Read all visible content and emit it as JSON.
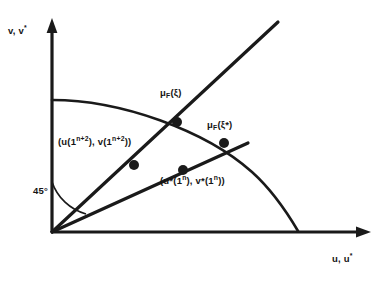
{
  "figure": {
    "type": "line-diagram",
    "background_color": "#ffffff",
    "stroke_color": "#1a1a1a",
    "axes": {
      "y_label": "v, v*",
      "y_label_base": "v, v",
      "y_label_sup": "*",
      "x_label": "u, u*",
      "x_label_base": "u, u",
      "x_label_sup": "*",
      "origin": {
        "x": 52,
        "y": 232
      },
      "y_axis_top": {
        "x": 52,
        "y": 22
      },
      "x_axis_right": {
        "x": 370,
        "y": 232
      }
    },
    "angle_marker": {
      "label": "45°",
      "value": 45,
      "unit": "degrees"
    },
    "labels": {
      "mu_xi": {
        "mu": "μ",
        "sub": "F",
        "arg": "(ξ)",
        "full": "μF(ξ)"
      },
      "mu_xi_star": {
        "mu": "μ",
        "sub": "F",
        "arg": "(ξ*)",
        "full": "μF(ξ*)"
      },
      "point_upper": {
        "prefix": "(u(1",
        "sup1": "n+2",
        "mid": "), v(1",
        "sup2": "n+2",
        "suffix": "))",
        "full": "(u(1^n+2), v(1^n+2))"
      },
      "point_lower": {
        "prefix": "(u*(1",
        "sup1": "n",
        "mid": "), v*(1",
        "sup2": "n",
        "suffix": "))",
        "full": "(u*(1^n), v*(1^n))"
      }
    },
    "curve": {
      "name": "frontier-curve",
      "description": "concave frontier from y-axis to x-axis",
      "start": {
        "x": 52,
        "y": 100
      },
      "end": {
        "x": 298,
        "y": 231
      }
    },
    "rays": [
      {
        "name": "ray-45-degree",
        "from": {
          "x": 52,
          "y": 232
        },
        "to": {
          "x": 278,
          "y": 22
        }
      },
      {
        "name": "ray-lower",
        "from": {
          "x": 52,
          "y": 232
        },
        "to": {
          "x": 248,
          "y": 143
        }
      }
    ],
    "points": [
      {
        "name": "point-mu-xi",
        "x": 177,
        "y": 122
      },
      {
        "name": "point-mu-xi-star",
        "x": 224,
        "y": 143
      },
      {
        "name": "point-upper-interior",
        "x": 134,
        "y": 165
      },
      {
        "name": "point-lower-interior",
        "x": 183,
        "y": 170
      }
    ]
  }
}
